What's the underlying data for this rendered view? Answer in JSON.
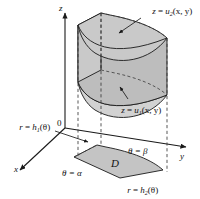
{
  "figure": {
    "background_color": "#ffffff",
    "line_color": "#1a1a1a",
    "surface_fill_top": "#c9c9c9",
    "surface_fill_side": "#bdbdbd",
    "surface_fill_base": "#c4c4c4",
    "surface_fill_lower": "#d2d2d2"
  },
  "axes": {
    "z_label": "z",
    "y_label": "y",
    "x_label": "x",
    "origin_label": "0"
  },
  "labels": {
    "upper_surface": {
      "lhs": "z",
      "eq": " = ",
      "fn": "u",
      "sub": "2",
      "args": "(x, y)"
    },
    "lower_surface": {
      "lhs": "z",
      "eq": " = ",
      "fn": "u",
      "sub": "1",
      "args": "(x, y)"
    },
    "inner_radius": {
      "lhs": "r",
      "eq": " = ",
      "fn": "h",
      "sub": "1",
      "args": "(θ)"
    },
    "outer_radius": {
      "lhs": "r",
      "eq": " = ",
      "fn": "h",
      "sub": "2",
      "args": "(θ)"
    },
    "theta_start": "θ = α",
    "theta_end": "θ = β",
    "region": "D"
  }
}
